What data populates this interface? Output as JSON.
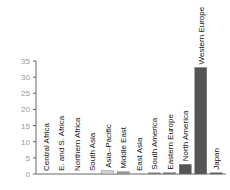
{
  "chart_data": {
    "type": "bar",
    "title": "",
    "xlabel": "",
    "ylabel": "",
    "ylim": [
      0,
      35
    ],
    "yticks": [
      0,
      5,
      10,
      15,
      20,
      25,
      30,
      35
    ],
    "grid": false,
    "categories": [
      "Central Africa",
      "E. and S. Africa",
      "Northern Africa",
      "South Asia",
      "Asia–Pacific",
      "Middle East",
      "East Asia",
      "South America",
      "Eastern Europe",
      "North America",
      "Western Europe",
      "Japan"
    ],
    "values": [
      0,
      0,
      0,
      0,
      1,
      0.7,
      0,
      0.3,
      0.4,
      3,
      33,
      0.3
    ],
    "colors": [
      "#ccc",
      "#ccc",
      "#ccc",
      "#ccc",
      "#d0d0d0",
      "#999",
      "#888",
      "#888",
      "#777",
      "#555",
      "#555",
      "#555"
    ]
  }
}
